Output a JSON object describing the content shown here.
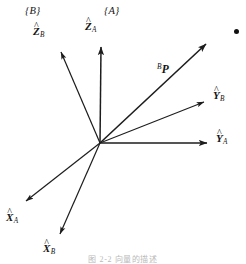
{
  "figure": {
    "background_color": "#ffffff",
    "stroke_color": "#1d1d1d",
    "width": 246,
    "height": 262,
    "origin": {
      "x": 100,
      "y": 143
    },
    "caption": "图 2-2 向量的描述"
  },
  "frames": [
    {
      "id": "frame-b",
      "label": "{B}",
      "x": 25,
      "y": 6
    },
    {
      "id": "frame-a",
      "label": "{A}",
      "x": 104,
      "y": 6
    }
  ],
  "axes": [
    {
      "id": "z-a",
      "name": "z-axis-frame-a",
      "base": "Z",
      "hat": "^",
      "subscript": "A",
      "tip": {
        "x": 101,
        "y": 43
      },
      "label": {
        "x": 85,
        "y": 21
      }
    },
    {
      "id": "z-b",
      "name": "z-axis-frame-b",
      "base": "Z",
      "hat": "^",
      "subscript": "B",
      "tip": {
        "x": 59,
        "y": 48
      },
      "label": {
        "x": 33,
        "y": 26
      }
    },
    {
      "id": "y-a",
      "name": "y-axis-frame-a",
      "base": "Y",
      "hat": "^",
      "subscript": "A",
      "tip": {
        "x": 212,
        "y": 143
      },
      "label": {
        "x": 216,
        "y": 133
      }
    },
    {
      "id": "y-b",
      "name": "y-axis-frame-b",
      "base": "Y",
      "hat": "^",
      "subscript": "B",
      "tip": {
        "x": 209,
        "y": 100
      },
      "label": {
        "x": 213,
        "y": 90
      }
    },
    {
      "id": "x-a",
      "name": "x-axis-frame-a",
      "base": "X",
      "hat": "^",
      "subscript": "A",
      "tip": {
        "x": 21,
        "y": 205
      },
      "label": {
        "x": 6,
        "y": 212
      }
    },
    {
      "id": "x-b",
      "name": "x-axis-frame-b",
      "base": "X",
      "hat": "^",
      "subscript": "B",
      "tip": {
        "x": 58,
        "y": 239
      },
      "label": {
        "x": 43,
        "y": 243
      }
    }
  ],
  "position_vector": {
    "id": "vector-p",
    "name": "position-vector-p",
    "superscript": "B",
    "base": "P",
    "tip": {
      "x": 210,
      "y": 40
    },
    "label": {
      "x": 157,
      "y": 63
    },
    "endpoint_dot": {
      "x": 236,
      "y": 31,
      "radius": 2.5
    }
  }
}
